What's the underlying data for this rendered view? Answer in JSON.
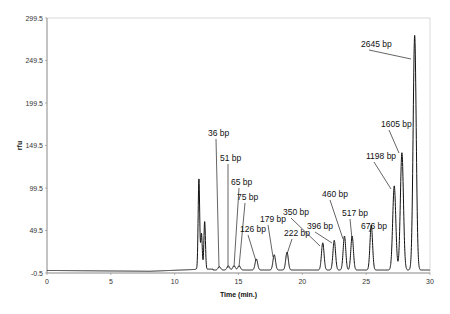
{
  "chart_data": {
    "type": "line",
    "title": "",
    "xlabel": "Time (min.)",
    "ylabel": "rfu",
    "xlim": [
      0,
      30
    ],
    "ylim": [
      -0.5,
      299.5
    ],
    "x_ticks": [
      0,
      5,
      10,
      15,
      20,
      25,
      30
    ],
    "y_ticks": [
      -0.5,
      49.5,
      99.5,
      149.5,
      199.5,
      249.5,
      299.5
    ],
    "y_tick_labels": [
      "-0.5",
      "49.5",
      "99.5",
      "149.5",
      "199.5",
      "249.5",
      "299.5"
    ],
    "grid": false,
    "legend": null,
    "series": [
      {
        "name": "electropherogram",
        "peaks": [
          {
            "time": 11.9,
            "height": 106,
            "label": ""
          },
          {
            "time": 12.1,
            "height": 42,
            "label": ""
          },
          {
            "time": 12.35,
            "height": 56,
            "label": ""
          },
          {
            "time": 13.5,
            "height": 4,
            "label": "36 bp"
          },
          {
            "time": 14.2,
            "height": 5,
            "label": "51 bp"
          },
          {
            "time": 14.65,
            "height": 5,
            "label": "65 bp"
          },
          {
            "time": 15.05,
            "height": 5,
            "label": "75 bp"
          },
          {
            "time": 16.4,
            "height": 13,
            "label": "126 bp"
          },
          {
            "time": 17.8,
            "height": 18,
            "label": "179 bp"
          },
          {
            "time": 18.8,
            "height": 21,
            "label": "222 bp"
          },
          {
            "time": 21.6,
            "height": 32,
            "label": "350 bp"
          },
          {
            "time": 22.5,
            "height": 35,
            "label": "396 bp"
          },
          {
            "time": 23.3,
            "height": 40,
            "label": "460 bp"
          },
          {
            "time": 23.9,
            "height": 40,
            "label": "517 bp"
          },
          {
            "time": 25.4,
            "height": 53,
            "label": "676 bp"
          },
          {
            "time": 27.2,
            "height": 99,
            "label": "1198 bp"
          },
          {
            "time": 27.8,
            "height": 138,
            "label": "1605 bp"
          },
          {
            "time": 28.8,
            "height": 276,
            "label": "2645 bp"
          }
        ]
      }
    ],
    "annotations": [
      {
        "text": "36 bp",
        "x": 208,
        "y": 136,
        "tx": 219,
        "ty": 268
      },
      {
        "text": "51 bp",
        "x": 220,
        "y": 161,
        "tx": 228,
        "ty": 268
      },
      {
        "text": "65 bp",
        "x": 231,
        "y": 185,
        "tx": 234,
        "ty": 267
      },
      {
        "text": "75 bp",
        "x": 237,
        "y": 200,
        "tx": 239,
        "ty": 267
      },
      {
        "text": "126 bp",
        "x": 240,
        "y": 232,
        "tx": 256,
        "ty": 261
      },
      {
        "text": "179 bp",
        "x": 260,
        "y": 222,
        "tx": 273,
        "ty": 257
      },
      {
        "text": "222 bp",
        "x": 284,
        "y": 236,
        "tx": 287,
        "ty": 254
      },
      {
        "text": "350 bp",
        "x": 283,
        "y": 215,
        "tx": 320,
        "ty": 246
      },
      {
        "text": "396 bp",
        "x": 307,
        "y": 229,
        "tx": 332,
        "ty": 243
      },
      {
        "text": "460 bp",
        "x": 322,
        "y": 197,
        "tx": 343,
        "ty": 239
      },
      {
        "text": "517 bp",
        "x": 342,
        "y": 216,
        "tx": 352,
        "ty": 239
      },
      {
        "text": "676 bp",
        "x": 361,
        "y": 229,
        "tx": 371,
        "ty": 228
      },
      {
        "text": "1198 bp",
        "x": 366,
        "y": 159,
        "tx": 391,
        "ty": 189
      },
      {
        "text": "1605 bp",
        "x": 381,
        "y": 127,
        "tx": 399,
        "ty": 153
      },
      {
        "text": "2645 bp",
        "x": 361,
        "y": 47,
        "tx": 411,
        "ty": 59
      }
    ]
  },
  "layout": {
    "plot_left": 47,
    "plot_right": 430,
    "plot_top": 18,
    "plot_bottom": 273,
    "line_color": "#111111",
    "axis_color": "#888888"
  }
}
